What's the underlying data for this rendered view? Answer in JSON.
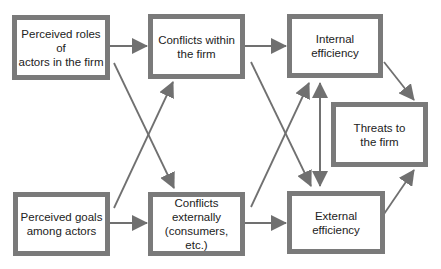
{
  "diagram": {
    "nodes": [
      {
        "id": "roles",
        "label": "Perceived roles of\nactors in the firm"
      },
      {
        "id": "conflicts_within",
        "label": "Conflicts within\nthe firm"
      },
      {
        "id": "internal",
        "label": "Internal\nefficiency"
      },
      {
        "id": "threats",
        "label": "Threats to\nthe firm"
      },
      {
        "id": "goals",
        "label": "Perceived goals\namong actors"
      },
      {
        "id": "conflicts_external",
        "label": "Conflicts\nexternally\n(consumers, etc.)"
      },
      {
        "id": "external",
        "label": "External\nefficiency"
      }
    ],
    "edges": [
      {
        "from": "roles",
        "to": "conflicts_within"
      },
      {
        "from": "roles",
        "to": "conflicts_external"
      },
      {
        "from": "goals",
        "to": "conflicts_within"
      },
      {
        "from": "goals",
        "to": "conflicts_external"
      },
      {
        "from": "conflicts_within",
        "to": "internal"
      },
      {
        "from": "conflicts_within",
        "to": "external"
      },
      {
        "from": "conflicts_external",
        "to": "internal"
      },
      {
        "from": "conflicts_external",
        "to": "external"
      },
      {
        "from": "external",
        "to": "internal"
      },
      {
        "from": "internal",
        "to": "external"
      },
      {
        "from": "internal",
        "to": "threats"
      },
      {
        "from": "external",
        "to": "threats"
      }
    ],
    "colors": {
      "border": "#7a7a7a",
      "arrow": "#707070",
      "text": "#222222"
    }
  }
}
